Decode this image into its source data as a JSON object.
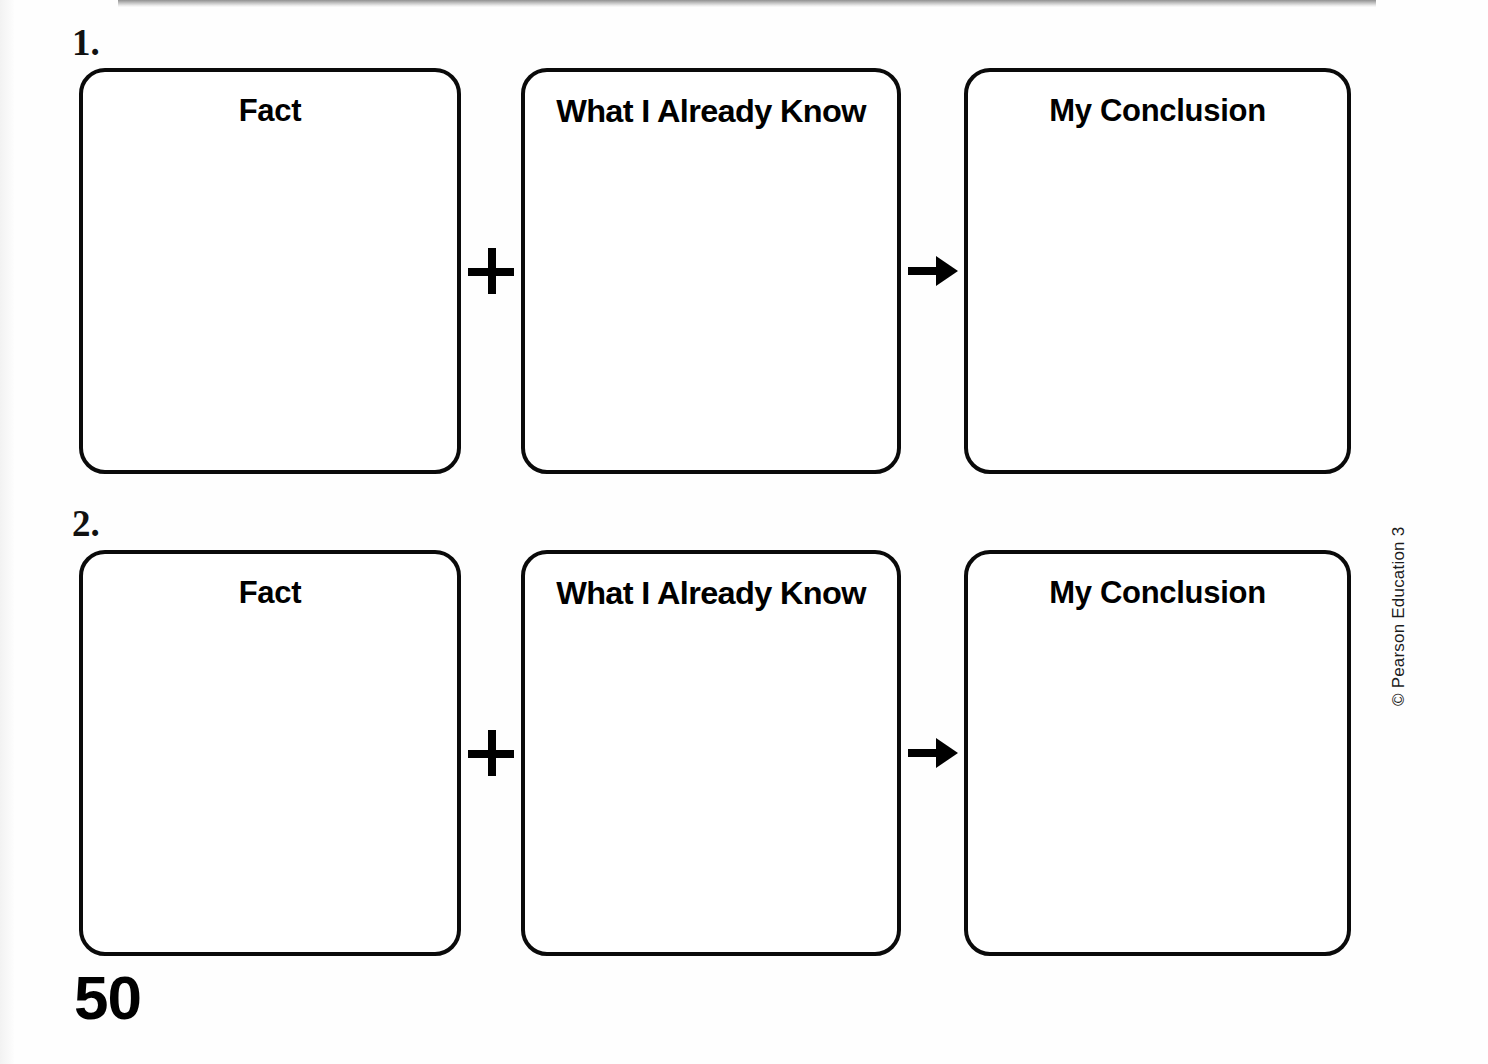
{
  "page": {
    "page_number": "50",
    "copyright": "© Pearson Education 3"
  },
  "column_titles": {
    "fact": "Fact",
    "prior_knowledge": "What I Already Know",
    "conclusion": "My Conclusion"
  },
  "connectors": {
    "plus_symbol": "+",
    "arrow_symbol": "→"
  },
  "exercises": [
    {
      "number": "1.",
      "boxes": [
        {
          "title": "Fact",
          "value": ""
        },
        {
          "title": "What I Already Know",
          "value": ""
        },
        {
          "title": "My Conclusion",
          "value": ""
        }
      ]
    },
    {
      "number": "2.",
      "boxes": [
        {
          "title": "Fact",
          "value": ""
        },
        {
          "title": "What I Already Know",
          "value": ""
        },
        {
          "title": "My Conclusion",
          "value": ""
        }
      ]
    }
  ],
  "colors": {
    "ink": "#000000",
    "paper": "#ffffff",
    "header_bar": "#7e7e7e"
  }
}
